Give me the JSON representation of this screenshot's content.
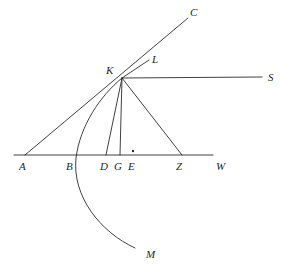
{
  "figure": {
    "background_color": "#ffffff",
    "stroke_color": "#2b2b2b",
    "label_color": "#1f1f1f"
  },
  "labels": {
    "A": "A",
    "B": "B",
    "C": "C",
    "D": "D",
    "E": "E",
    "G": "G",
    "K": "K",
    "L": "L",
    "M": "M",
    "S": "S",
    "W": "W",
    "Z": "Z"
  },
  "points": [
    {
      "name": "A",
      "label": "A",
      "x": 25,
      "y": 155,
      "label_x": 19,
      "label_y": 170
    },
    {
      "name": "B",
      "label": "B",
      "x": 72,
      "y": 155,
      "label_x": 66,
      "label_y": 170
    },
    {
      "name": "C",
      "label": "C",
      "x": 188,
      "y": 18,
      "label_x": 190,
      "label_y": 15
    },
    {
      "name": "D",
      "label": "D",
      "x": 106,
      "y": 155,
      "label_x": 100,
      "label_y": 170
    },
    {
      "name": "E",
      "label": "E",
      "x": 133,
      "y": 155,
      "label_x": 128,
      "label_y": 170
    },
    {
      "name": "G",
      "label": "G",
      "x": 120,
      "y": 155,
      "label_x": 114,
      "label_y": 170
    },
    {
      "name": "K",
      "label": "K",
      "x": 122,
      "y": 78,
      "label_x": 108,
      "label_y": 75
    },
    {
      "name": "L",
      "label": "L",
      "x": 150,
      "y": 62,
      "label_x": 152,
      "label_y": 62
    },
    {
      "name": "M",
      "label": "M",
      "x": 135,
      "y": 248,
      "label_x": 146,
      "label_y": 257
    },
    {
      "name": "S",
      "label": "S",
      "x": 262,
      "y": 77,
      "label_x": 268,
      "label_y": 80
    },
    {
      "name": "W",
      "label": "W",
      "x": 213,
      "y": 155,
      "label_x": 216,
      "label_y": 170
    },
    {
      "name": "Z",
      "label": "Z",
      "x": 182,
      "y": 155,
      "label_x": 176,
      "label_y": 170
    }
  ],
  "segments": [
    {
      "name": "baseline-A-W",
      "from": [
        14,
        155
      ],
      "to": [
        213,
        155
      ]
    },
    {
      "name": "ray-A-to-C",
      "from": [
        25,
        155
      ],
      "to": [
        188,
        18
      ]
    },
    {
      "name": "ray-K-to-S",
      "from": [
        122,
        78
      ],
      "to": [
        262,
        77
      ]
    },
    {
      "name": "segment-K-D",
      "from": [
        122,
        78
      ],
      "to": [
        106,
        155
      ]
    },
    {
      "name": "segment-K-G",
      "from": [
        122,
        78
      ],
      "to": [
        120,
        155
      ]
    },
    {
      "name": "segment-K-Z",
      "from": [
        122,
        78
      ],
      "to": [
        182,
        155
      ]
    },
    {
      "name": "tick-L-at-K",
      "from": [
        122,
        78
      ],
      "to": [
        149,
        60
      ]
    }
  ],
  "arcs": [
    {
      "name": "arc-K-B-M",
      "description": "curve from K through B down to M",
      "path": "M 122 78 C 100 96, 80 126, 76 158 C 72 196, 100 232, 135 248"
    }
  ],
  "dots": [
    {
      "name": "point-E-dot",
      "x": 133,
      "y": 151,
      "r": 1.2
    }
  ]
}
